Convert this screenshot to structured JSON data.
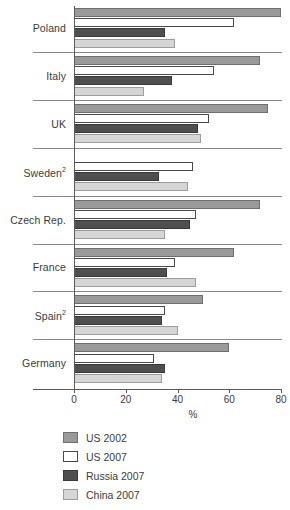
{
  "chart_data": {
    "type": "bar",
    "orientation": "horizontal",
    "title": "",
    "xlabel": "%",
    "ylabel": "",
    "xlim": [
      0,
      80
    ],
    "xticks": [
      0,
      20,
      40,
      60,
      80
    ],
    "xtick_labels": [
      "0",
      "20",
      "40",
      "60",
      "80"
    ],
    "grid": false,
    "legend_position": "bottom-left",
    "categories": [
      "Poland",
      "Italy",
      "UK",
      "Sweden²",
      "Czech Rep.",
      "France",
      "Spain²",
      "Germany"
    ],
    "category_notes": {
      "Sweden²": "2",
      "Spain²": "2"
    },
    "series": [
      {
        "name": "US 2002",
        "color": "#9a9a9a",
        "values": [
          80,
          72,
          75,
          null,
          72,
          62,
          50,
          60
        ]
      },
      {
        "name": "US 2007",
        "color": "#ffffff",
        "values": [
          62,
          54,
          52,
          46,
          47,
          39,
          35,
          31
        ]
      },
      {
        "name": "Russia 2007",
        "color": "#4f4f4f",
        "values": [
          35,
          38,
          48,
          33,
          45,
          36,
          34,
          35
        ]
      },
      {
        "name": "China 2007",
        "color": "#d5d5d5",
        "values": [
          39,
          27,
          49,
          44,
          35,
          47,
          40,
          34
        ]
      }
    ]
  },
  "legend": {
    "items": [
      {
        "label": "US 2002"
      },
      {
        "label": "US 2007"
      },
      {
        "label": "Russia 2007"
      },
      {
        "label": "China 2007"
      }
    ]
  }
}
